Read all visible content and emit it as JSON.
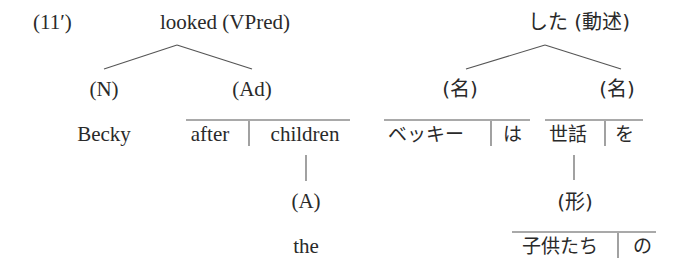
{
  "example_label": "(11′)",
  "english_tree": {
    "root": "looked (VPred)",
    "children": [
      {
        "category": "(N)",
        "words": [
          "Becky"
        ]
      },
      {
        "category": "(Ad)",
        "words": [
          "after",
          "children"
        ],
        "dependent": {
          "attached_to": "children",
          "category": "(A)",
          "words": [
            "the"
          ]
        }
      }
    ]
  },
  "japanese_tree": {
    "root": "した (動述)",
    "children": [
      {
        "category": "(名)",
        "words": [
          "ベッキー",
          "は"
        ]
      },
      {
        "category": "(名)",
        "words": [
          "世話",
          "を"
        ],
        "dependent": {
          "attached_to": "世話",
          "category": "(形)",
          "words": [
            "子供たち",
            "の"
          ]
        }
      }
    ]
  }
}
